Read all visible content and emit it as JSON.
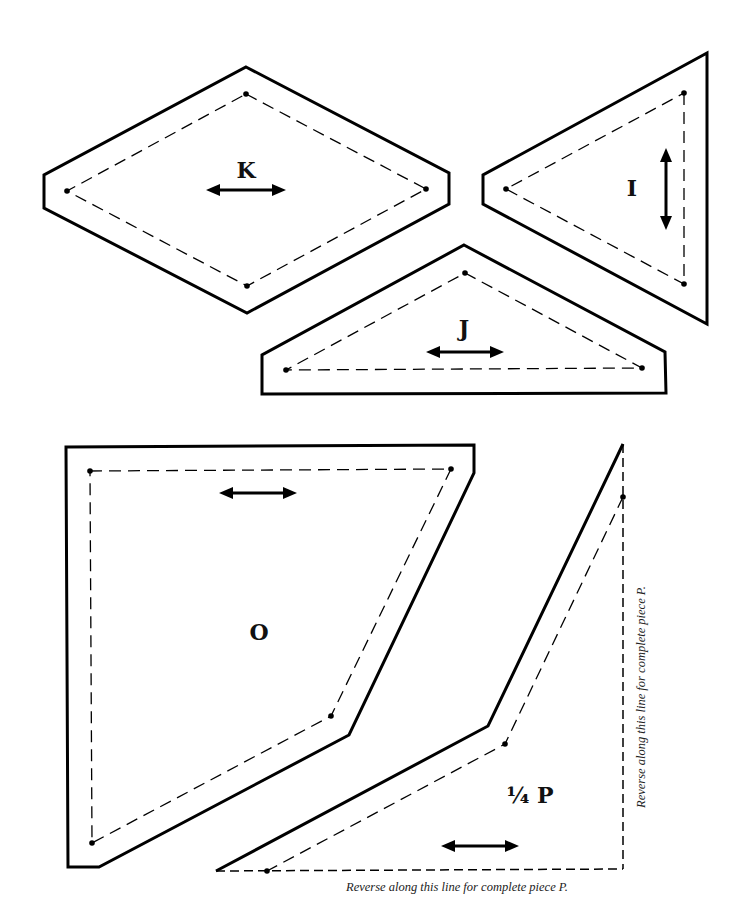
{
  "colors": {
    "ink": "#000000",
    "paper": "#ffffff"
  },
  "pieces": {
    "K": {
      "label": "K",
      "grainline": "horizontal"
    },
    "I": {
      "label": "I",
      "grainline": "vertical"
    },
    "J": {
      "label": "J",
      "grainline": "horizontal"
    },
    "O": {
      "label": "O",
      "grainline": "horizontal"
    },
    "P": {
      "label": "¼ P",
      "grainline": "horizontal"
    }
  },
  "notes": {
    "fold_vertical": "Reverse along this line for complete piece P.",
    "fold_bottom": "Reverse along this line for complete piece P."
  }
}
